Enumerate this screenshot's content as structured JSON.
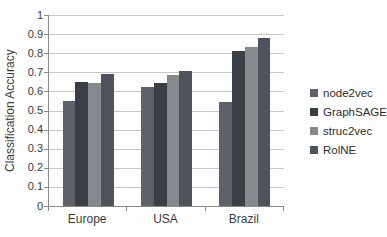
{
  "chart_data": {
    "type": "bar",
    "title": "",
    "xlabel": "",
    "ylabel": "Classification Accuracy",
    "categories": [
      "Europe",
      "USA",
      "Brazil"
    ],
    "series": [
      {
        "name": "node2vec",
        "color": "#5e6268",
        "values": [
          0.55,
          0.625,
          0.545
        ]
      },
      {
        "name": "GraphSAGE",
        "color": "#3a3e45",
        "values": [
          0.65,
          0.645,
          0.81
        ]
      },
      {
        "name": "struc2vec",
        "color": "#85898e",
        "values": [
          0.645,
          0.685,
          0.835
        ]
      },
      {
        "name": "RolNE",
        "color": "#4e525a",
        "values": [
          0.69,
          0.705,
          0.88
        ]
      }
    ],
    "ylim": [
      0,
      1
    ],
    "ytick_step": 0.1,
    "ytick_labels": [
      "0",
      "0.1",
      "0.2",
      "0.3",
      "0.4",
      "0.5",
      "0.6",
      "0.7",
      "0.8",
      "0.9",
      "1"
    ],
    "grid": true,
    "legend_position": "right",
    "colors_note": {
      "gridline": "#c7c7c7",
      "axis": "#8a8a8a",
      "text": "#3b3b3b",
      "background": "#fefefe"
    }
  }
}
